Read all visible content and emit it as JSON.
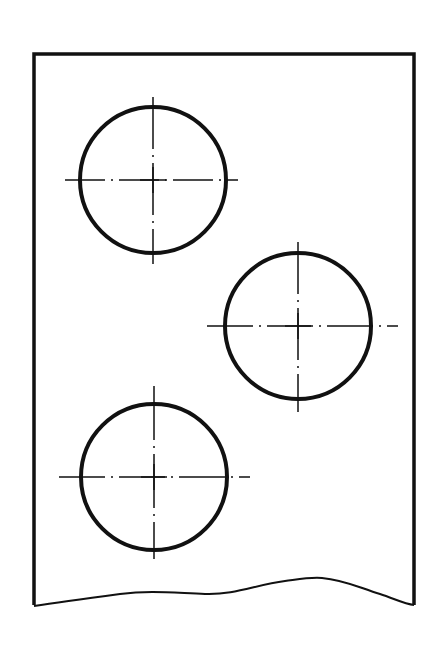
{
  "diagram": {
    "type": "technical-drawing",
    "colors": {
      "line": "#111111",
      "background": "#ffffff"
    },
    "plate": {
      "left": 33,
      "top": 53,
      "right": 415,
      "break_line": "wavy"
    },
    "holes": [
      {
        "id": "hole-top-left",
        "cx": 153,
        "cy": 180,
        "r": 73
      },
      {
        "id": "hole-right",
        "cx": 298,
        "cy": 326,
        "r": 73
      },
      {
        "id": "hole-bottom-left",
        "cx": 154,
        "cy": 477,
        "r": 73
      }
    ]
  }
}
